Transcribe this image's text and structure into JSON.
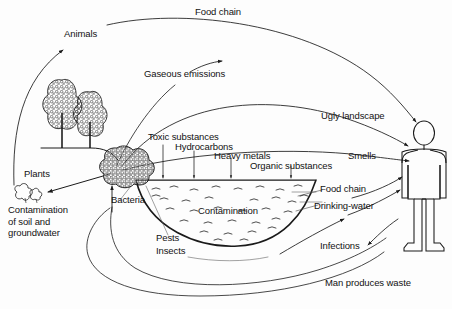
{
  "diagram": {
    "type": "flow-diagram",
    "stroke_color": "#1a1a1a",
    "text_color": "#121212",
    "background_color": "#fdfdfd",
    "labels": {
      "food_chain_top": "Food chain",
      "animals": "Animals",
      "gaseous_emissions": "Gaseous emissions",
      "ugly_landscape": "Ugly landscape",
      "smells": "Smells",
      "toxic_substances": "Toxic substances",
      "hydrocarbons": "Hydrocarbons",
      "heavy_metals": "Heavy metals",
      "organic_substances": "Organic substances",
      "plants": "Plants",
      "contamination_soil": "Contamination\nof soil and\ngroundwater",
      "bacteria": "Bacteria",
      "contamination_pit": "Contamination",
      "food_chain_right": "Food chain",
      "drinking_water": "Drinking-water",
      "pests": "Pests",
      "insects": "Insects",
      "infections": "Infections",
      "man_produces_waste": "Man produces waste"
    },
    "figures": {
      "human": "human-figure",
      "trees": "tree-group",
      "waste_pile": "waste-pile",
      "plant_sprouts": "plant-sprouts",
      "pit": "contamination-pit"
    },
    "flows": [
      {
        "name": "food-chain-top",
        "from": "landfill-area",
        "to": "human",
        "label": "Food chain"
      },
      {
        "name": "animals",
        "from": "contamination",
        "to": "animals",
        "label": "Animals"
      },
      {
        "name": "gaseous-emissions",
        "from": "waste-pile",
        "to": "atmosphere",
        "label": "Gaseous emissions"
      },
      {
        "name": "ugly-landscape",
        "from": "landfill",
        "to": "human",
        "label": "Ugly landscape"
      },
      {
        "name": "smells",
        "from": "landfill",
        "to": "human",
        "label": "Smells"
      },
      {
        "name": "toxic-substances",
        "from": "surface",
        "to": "pit",
        "label": "Toxic substances"
      },
      {
        "name": "hydrocarbons",
        "from": "surface",
        "to": "pit",
        "label": "Hydrocarbons"
      },
      {
        "name": "heavy-metals",
        "from": "surface",
        "to": "pit",
        "label": "Heavy metals"
      },
      {
        "name": "organic-substances",
        "from": "surface",
        "to": "pit",
        "label": "Organic substances"
      },
      {
        "name": "soil-groundwater",
        "from": "waste-pile",
        "to": "plants",
        "label": "Contamination of soil and groundwater"
      },
      {
        "name": "food-chain-right",
        "from": "pit",
        "to": "human",
        "label": "Food chain"
      },
      {
        "name": "drinking-water",
        "from": "pit",
        "to": "human",
        "label": "Drinking-water"
      },
      {
        "name": "pests-insects",
        "from": "waste-pile",
        "to": "human",
        "label": "Pests Insects"
      },
      {
        "name": "infections",
        "from": "pests",
        "to": "human",
        "label": "Infections"
      },
      {
        "name": "man-produces-waste",
        "from": "human",
        "to": "waste-pile",
        "label": "Man produces waste"
      }
    ]
  }
}
